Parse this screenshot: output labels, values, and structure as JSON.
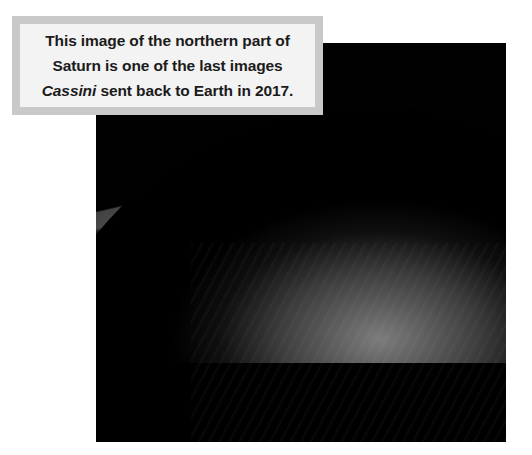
{
  "caption": {
    "text_before_italic": "This image of the northern part of Saturn is one of the last images ",
    "italic_word": "Cassini",
    "text_after_italic": " sent back to Earth in 2017.",
    "full_text": "This image of the northern part of Saturn is one of the last images Cassini sent back to Earth in 2017.",
    "border_color": "#c9c9c9",
    "background_color": "#f3f3f3",
    "text_color": "#1b1b1b"
  },
  "photo": {
    "subject": "saturn-northern-hemisphere",
    "background_color": "#000000",
    "limb_highlight_color": "#dddddd",
    "ring_color": "#585858"
  },
  "page": {
    "background_color": "#ffffff"
  }
}
